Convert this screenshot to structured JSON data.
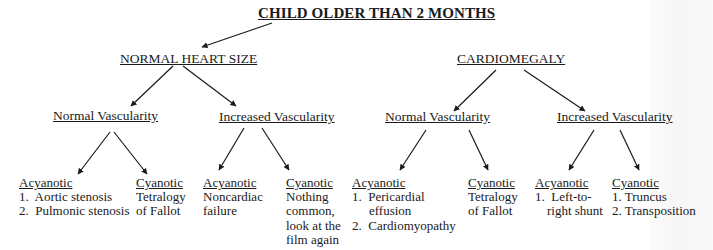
{
  "title": "CHILD OLDER THAN 2 MONTHS",
  "branches": [
    {
      "label": "NORMAL HEART SIZE",
      "children": [
        {
          "label": "Normal Vascularity",
          "leaves": [
            {
              "head": "Acyanotic",
              "lines": [
                "1.  Aortic stenosis",
                "2.  Pulmonic stenosis"
              ]
            },
            {
              "head": "Cyanotic",
              "lines": [
                "Tetralogy",
                "of Fallot"
              ]
            }
          ]
        },
        {
          "label": "Increased Vascularity",
          "leaves": [
            {
              "head": "Acyanotic",
              "lines": [
                "Noncardiac",
                "failure"
              ]
            },
            {
              "head": "Cyanotic",
              "lines": [
                "Nothing",
                "common,",
                "look at the",
                "film again"
              ]
            }
          ]
        }
      ]
    },
    {
      "label": "CARDIOMEGALY",
      "children": [
        {
          "label": "Normal Vascularity",
          "leaves": [
            {
              "head": "Acyanotic",
              "lines": [
                "1.  Pericardial",
                "effusion",
                "2.  Cardiomyopathy"
              ]
            },
            {
              "head": "Cyanotic",
              "lines": [
                "Tetralogy",
                "of Fallot"
              ]
            }
          ]
        },
        {
          "label": "Increased Vascularity",
          "leaves": [
            {
              "head": "Acyanotic",
              "lines": [
                "1.  Left-to-",
                "right shunt"
              ]
            },
            {
              "head": "Cyanotic",
              "lines": [
                "1. Truncus",
                "2. Transposition"
              ]
            }
          ]
        }
      ]
    }
  ],
  "colors": {
    "text": "#1a1a1a",
    "background": "#ffffff",
    "arrow": "#1a1a1a"
  }
}
